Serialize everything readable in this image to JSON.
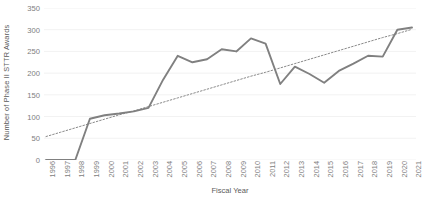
{
  "chart_data": {
    "type": "line",
    "title": "",
    "xlabel": "Fiscal Year",
    "ylabel": "Number of Phase II STTR Awards",
    "x": [
      1996,
      1997,
      1998,
      1999,
      2000,
      2001,
      2002,
      2003,
      2004,
      2005,
      2006,
      2007,
      2008,
      2009,
      2010,
      2011,
      2012,
      2013,
      2014,
      2015,
      2016,
      2017,
      2018,
      2019,
      2020,
      2021
    ],
    "categories": [
      "1996",
      "1997",
      "1998",
      "1999",
      "2000",
      "2001",
      "2002",
      "2003",
      "2004",
      "2005",
      "2006",
      "2007",
      "2008",
      "2009",
      "2010",
      "2011",
      "2012",
      "2013",
      "2014",
      "2015",
      "2016",
      "2017",
      "2018",
      "2019",
      "2020",
      "2021"
    ],
    "series": [
      {
        "name": "Number of Phase II STTR Awards",
        "style": "solid",
        "color": "#808080",
        "values": [
          0,
          0,
          0,
          95,
          103,
          107,
          112,
          120,
          185,
          240,
          225,
          232,
          255,
          250,
          280,
          268,
          175,
          215,
          198,
          178,
          205,
          222,
          240,
          238,
          300,
          305
        ]
      },
      {
        "name": "Linear trendline",
        "style": "dotted",
        "color": "#8a8a8a",
        "values": [
          54,
          64,
          74,
          84,
          94,
          104,
          113,
          123,
          133,
          143,
          153,
          163,
          173,
          183,
          193,
          202,
          212,
          222,
          232,
          242,
          252,
          262,
          272,
          282,
          291,
          301
        ]
      }
    ],
    "ylim": [
      0,
      350
    ],
    "yticks": [
      0,
      50,
      100,
      150,
      200,
      250,
      300,
      350
    ],
    "ytick_labels": [
      "0",
      "50",
      "100",
      "150",
      "200",
      "250",
      "300",
      "350"
    ],
    "grid": "horizontal-faint",
    "legend": "none",
    "gridline_color": "#f2f2f2"
  }
}
